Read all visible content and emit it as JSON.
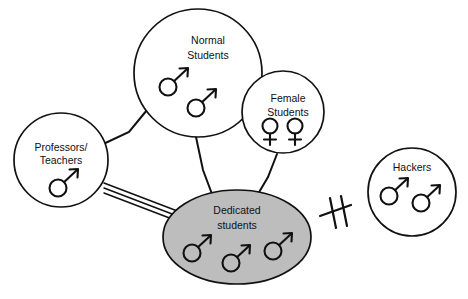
{
  "diagram": {
    "background_color": "#ffffff",
    "stroke_color": "#111111",
    "highlight_fill_color": "#bdbdbd",
    "nodes": [
      {
        "id": "professors",
        "label_lines": [
          "Professors/",
          "Teachers"
        ],
        "shape": "circle",
        "filled": false,
        "symbols": [
          "male"
        ],
        "symbol_count": 1
      },
      {
        "id": "normal-students",
        "label_lines": [
          "Normal",
          "Students"
        ],
        "shape": "circle",
        "filled": false,
        "symbols": [
          "male",
          "male"
        ],
        "symbol_count": 2
      },
      {
        "id": "female-students",
        "label_lines": [
          "Female",
          "Students"
        ],
        "shape": "circle",
        "filled": false,
        "symbols": [
          "female",
          "female"
        ],
        "symbol_count": 2
      },
      {
        "id": "dedicated-students",
        "label_lines": [
          "Dedicated",
          "students"
        ],
        "shape": "ellipse",
        "filled": true,
        "symbols": [
          "male",
          "male",
          "male"
        ],
        "symbol_count": 3
      },
      {
        "id": "hackers",
        "label_lines": [
          "Hackers"
        ],
        "shape": "circle",
        "filled": false,
        "symbols": [
          "male",
          "male"
        ],
        "symbol_count": 2
      }
    ],
    "edges": [
      {
        "id": "professors-normal",
        "from": "professors",
        "to": "normal-students",
        "style": "single-line"
      },
      {
        "id": "professors-dedicated",
        "from": "professors",
        "to": "dedicated-students",
        "style": "triple-line"
      },
      {
        "id": "normal-dedicated",
        "from": "normal-students",
        "to": "dedicated-students",
        "style": "single-line"
      },
      {
        "id": "female-dedicated",
        "from": "female-students",
        "to": "dedicated-students",
        "style": "single-line"
      },
      {
        "id": "dedicated-hackers",
        "from": "dedicated-students",
        "to": "hackers",
        "style": "broken-crossed-out"
      }
    ],
    "markers": [
      {
        "id": "no-connection",
        "name": "crossed-out-link-marker",
        "meaning": "no connection"
      }
    ]
  }
}
